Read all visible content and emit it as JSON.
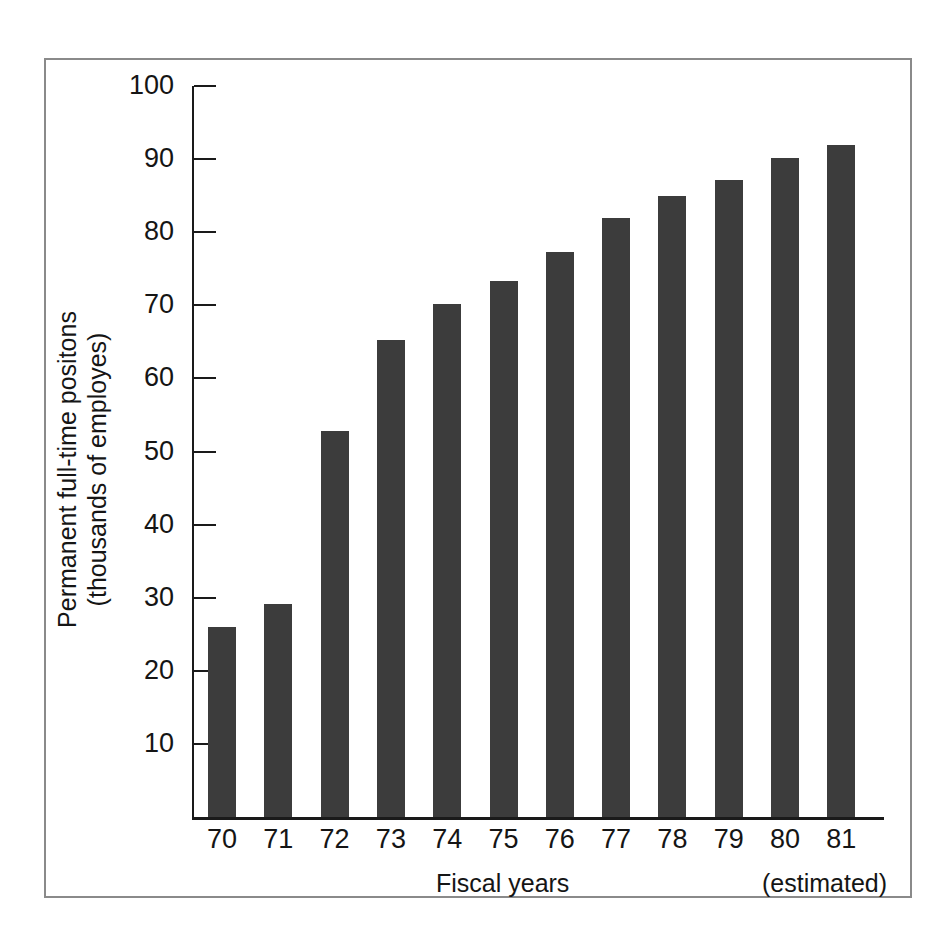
{
  "chart_data": {
    "type": "bar",
    "title": "",
    "subtitle": "",
    "xlabel": "Fiscal years",
    "xlabel_note": "(estimated)",
    "ylabel_line1": "Permanent full-time positons",
    "ylabel_line2": "(thousands of employes)",
    "categories": [
      "70",
      "71",
      "72",
      "73",
      "74",
      "75",
      "76",
      "77",
      "78",
      "79",
      "80",
      "81"
    ],
    "values": [
      26.0,
      29.2,
      52.8,
      65.3,
      70.2,
      73.3,
      77.3,
      82.0,
      85.0,
      87.2,
      90.1,
      91.9
    ],
    "series": [
      {
        "name": "Permanent full-time positions",
        "values": [
          26.0,
          29.2,
          52.8,
          65.3,
          70.2,
          73.3,
          77.3,
          82.0,
          85.0,
          87.2,
          90.1,
          91.9
        ]
      }
    ],
    "ylim": [
      0,
      100
    ],
    "y_ticks": [
      10,
      20,
      30,
      40,
      50,
      60,
      70,
      80,
      90,
      100
    ],
    "y_tick_labels": [
      "10",
      "20",
      "30",
      "40",
      "50",
      "60",
      "70",
      "80",
      "90",
      "100"
    ],
    "grid": false,
    "legend": false,
    "legend_position": "none",
    "bar_color": "#3c3c3c",
    "axis_color": "#1a1a1a",
    "frame_color": "#8a8a8a",
    "background_color": "#ffffff",
    "estimated_categories": [
      "81"
    ]
  }
}
